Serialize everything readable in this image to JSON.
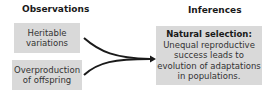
{
  "columns": {
    "left_heading": "Observations",
    "right_heading": "Inferences"
  },
  "observations": [
    {
      "line1": "Heritable",
      "line2": "variations"
    },
    {
      "line1": "Overproduction",
      "line2": "of offspring"
    }
  ],
  "inference": {
    "title": "Natural selection:",
    "lines": [
      "Unequal reproductive",
      "success leads to",
      "evolution of adaptations",
      "in populations."
    ]
  },
  "colors": {
    "box_fill": "#d9d9d9",
    "arrow": "#1a1a1a"
  }
}
